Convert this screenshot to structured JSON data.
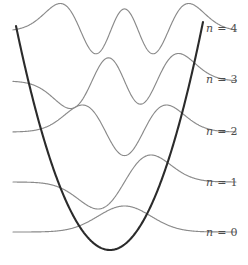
{
  "figure": {
    "background_color": "#ffffff",
    "potential_color": "#2b2b2b",
    "wave_color": "#8a8a8a",
    "label_color": "#4d4d4d"
  },
  "labels": [
    {
      "id": "n4",
      "text": "n = 4",
      "var": "n",
      "eq": " = ",
      "value": "4",
      "x": 206,
      "y": 22
    },
    {
      "id": "n3",
      "text": "n = 3",
      "var": "n",
      "eq": " = ",
      "value": "3",
      "x": 206,
      "y": 73
    },
    {
      "id": "n2",
      "text": "n = 2",
      "var": "n",
      "eq": " = ",
      "value": "2",
      "x": 206,
      "y": 125
    },
    {
      "id": "n1",
      "text": "n = 1",
      "var": "n",
      "eq": " = ",
      "value": "1",
      "x": 206,
      "y": 176
    },
    {
      "id": "n0",
      "text": "n = 0",
      "var": "n",
      "eq": " = ",
      "value": "0",
      "x": 206,
      "y": 226
    }
  ],
  "chart_data": {
    "type": "line",
    "xlabel": "",
    "ylabel": "",
    "grid": false,
    "legend_position": "right",
    "xlim": [
      -4.2,
      4.2
    ],
    "ylim": [
      0,
      5
    ],
    "potential": {
      "name": "V(x) = 0.5 x^2",
      "color": "#2b2b2b",
      "vertex": {
        "x": 110,
        "y": 250
      },
      "left_top": {
        "x": 16,
        "y": 26
      },
      "right_top": {
        "x": 203,
        "y": 22
      }
    },
    "series": [
      {
        "name": "n = 0",
        "quantum_number": 0,
        "nodes": 0,
        "extrema": 1,
        "baseline_y": 232,
        "energy_level": 0.5,
        "color": "#8a8a8a"
      },
      {
        "name": "n = 1",
        "quantum_number": 1,
        "nodes": 1,
        "extrema": 2,
        "baseline_y": 182,
        "energy_level": 1.5,
        "color": "#8a8a8a"
      },
      {
        "name": "n = 2",
        "quantum_number": 2,
        "nodes": 2,
        "extrema": 3,
        "baseline_y": 132,
        "energy_level": 2.5,
        "color": "#8a8a8a"
      },
      {
        "name": "n = 3",
        "quantum_number": 3,
        "nodes": 3,
        "extrema": 4,
        "baseline_y": 81,
        "energy_level": 3.5,
        "color": "#8a8a8a"
      },
      {
        "name": "n = 4",
        "quantum_number": 4,
        "nodes": 4,
        "extrema": 5,
        "baseline_y": 31,
        "energy_level": 4.5,
        "color": "#8a8a8a"
      }
    ]
  }
}
